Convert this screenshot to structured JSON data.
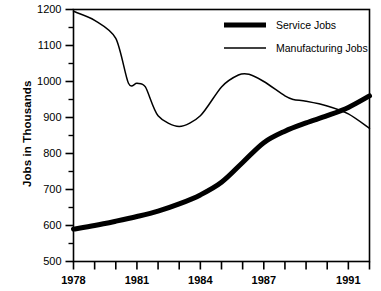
{
  "chart_data": {
    "type": "line",
    "title": "",
    "xlabel": "",
    "ylabel": "Jobs in Thousands",
    "xlim": [
      1978,
      1992
    ],
    "ylim": [
      500,
      1200
    ],
    "grid": false,
    "legend_position": "top-right inside plot",
    "y_ticks": [
      500,
      600,
      700,
      800,
      900,
      1000,
      1100,
      1200
    ],
    "y_tick_labels": [
      "500",
      "600",
      "700",
      "800",
      "900",
      "1000",
      "1100",
      "1200"
    ],
    "y_minor_ticks": [
      550,
      650,
      750,
      850,
      950,
      1050,
      1150
    ],
    "x_ticks": [
      1978,
      1979,
      1980,
      1981,
      1982,
      1983,
      1984,
      1985,
      1986,
      1987,
      1988,
      1989,
      1990,
      1991,
      1992
    ],
    "x_tick_labels": [
      "1978",
      "1981",
      "1984",
      "1987",
      "1991"
    ],
    "x_labeled_ticks": [
      1978,
      1981,
      1984,
      1987,
      1991
    ],
    "series": [
      {
        "name": "Service Jobs",
        "style": "thick",
        "color": "#000000",
        "x": [
          1978,
          1979,
          1980,
          1981,
          1982,
          1983,
          1984,
          1985,
          1986,
          1987,
          1988,
          1989,
          1990,
          1991,
          1992
        ],
        "values": [
          590,
          600,
          612,
          625,
          640,
          660,
          685,
          720,
          775,
          830,
          862,
          885,
          905,
          928,
          960
        ]
      },
      {
        "name": "Manufacturing Jobs",
        "style": "thin",
        "color": "#000000",
        "x": [
          1978,
          1979,
          1980,
          1980.6,
          1981,
          1981.4,
          1982,
          1983,
          1984,
          1985,
          1985.8,
          1986.3,
          1987,
          1988,
          1988.4,
          1989,
          1990,
          1991,
          1992
        ],
        "values": [
          1195,
          1170,
          1120,
          995,
          995,
          985,
          905,
          875,
          905,
          985,
          1018,
          1020,
          1000,
          960,
          950,
          945,
          932,
          910,
          870
        ]
      }
    ],
    "annotations": []
  },
  "legend": {
    "items": [
      {
        "label": "Service Jobs",
        "style": "thick"
      },
      {
        "label": "Manufacturing Jobs",
        "style": "thin"
      }
    ]
  },
  "axes": {
    "y_title": "Jobs in Thousands"
  }
}
